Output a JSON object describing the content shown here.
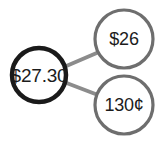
{
  "diagram": {
    "type": "node-link",
    "background_color": "#ffffff",
    "edge_color": "#8c8c8c",
    "root": {
      "label": "$27.30",
      "stroke_color": "#1a1a1a",
      "text_color": "#1c1c1c",
      "cx": 39,
      "cy": 75,
      "r": 27,
      "stroke_width": 4.5
    },
    "children": [
      {
        "label": "$26",
        "stroke_color": "#6e6e6e",
        "text_color": "#1c1c1c",
        "cx": 124,
        "cy": 39,
        "r": 29,
        "stroke_width": 3.2
      },
      {
        "label": "130¢",
        "stroke_color": "#6e6e6e",
        "text_color": "#1c1c1c",
        "cx": 124,
        "cy": 105,
        "r": 29,
        "stroke_width": 3.2
      }
    ],
    "edges": [
      {
        "from": "$27.30",
        "to": "$26",
        "x1": 64,
        "y1": 67,
        "x2": 99,
        "y2": 52,
        "width": 4
      },
      {
        "from": "$27.30",
        "to": "130¢",
        "x1": 64,
        "y1": 82,
        "x2": 98,
        "y2": 95,
        "width": 4
      }
    ]
  }
}
